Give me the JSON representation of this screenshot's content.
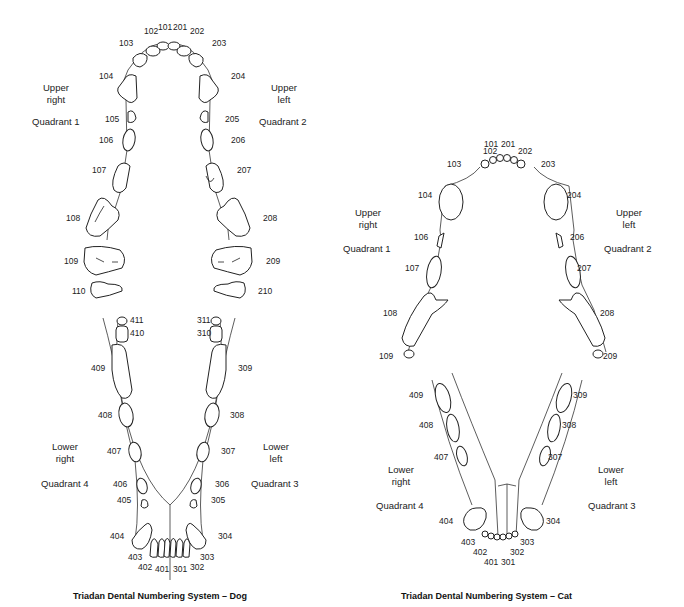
{
  "dog": {
    "caption": "Triadan Dental Numbering System – Dog",
    "quadrants": {
      "q1": {
        "line1": "Upper",
        "line2": "right",
        "name": "Quadrant 1"
      },
      "q2": {
        "line1": "Upper",
        "line2": "left",
        "name": "Quadrant 2"
      },
      "q3": {
        "line1": "Lower",
        "line2": "left",
        "name": "Quadrant 3"
      },
      "q4": {
        "line1": "Lower",
        "line2": "right",
        "name": "Quadrant 4"
      }
    },
    "teeth": {
      "t101": "101",
      "t102": "102",
      "t103": "103",
      "t104": "104",
      "t105": "105",
      "t106": "106",
      "t107": "107",
      "t108": "108",
      "t109": "109",
      "t110": "110",
      "t201": "201",
      "t202": "202",
      "t203": "203",
      "t204": "204",
      "t205": "205",
      "t206": "206",
      "t207": "207",
      "t208": "208",
      "t209": "209",
      "t210": "210",
      "t301": "301",
      "t302": "302",
      "t303": "303",
      "t304": "304",
      "t305": "305",
      "t306": "306",
      "t307": "307",
      "t308": "308",
      "t309": "309",
      "t310": "310",
      "t311": "311",
      "t401": "401",
      "t402": "402",
      "t403": "403",
      "t404": "404",
      "t405": "405",
      "t406": "406",
      "t407": "407",
      "t408": "408",
      "t409": "409",
      "t410": "410",
      "t411": "411"
    }
  },
  "cat": {
    "caption": "Triadan Dental Numbering System – Cat",
    "quadrants": {
      "q1": {
        "line1": "Upper",
        "line2": "right",
        "name": "Quadrant 1"
      },
      "q2": {
        "line1": "Upper",
        "line2": "left",
        "name": "Quadrant 2"
      },
      "q3": {
        "line1": "Lower",
        "line2": "left",
        "name": "Quadrant 3"
      },
      "q4": {
        "line1": "Lower",
        "line2": "right",
        "name": "Quadrant 4"
      }
    },
    "teeth": {
      "t101": "101",
      "t102": "102",
      "t103": "103",
      "t104": "104",
      "t106": "106",
      "t107": "107",
      "t108": "108",
      "t109": "109",
      "t201": "201",
      "t202": "202",
      "t203": "203",
      "t204": "204",
      "t206": "206",
      "t207": "207",
      "t208": "208",
      "t209": "209",
      "t301": "301",
      "t302": "302",
      "t303": "303",
      "t304": "304",
      "t307": "307",
      "t308": "308",
      "t309": "309",
      "t401": "401",
      "t402": "402",
      "t403": "403",
      "t404": "404",
      "t407": "407",
      "t408": "408",
      "t409": "409"
    }
  }
}
